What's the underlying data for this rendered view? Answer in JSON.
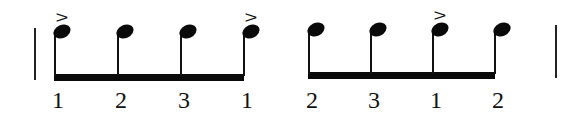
{
  "notation": {
    "barlines": [
      {
        "name": "left-barline",
        "x": 34,
        "top": 28,
        "bottom": 80
      },
      {
        "name": "right-barline",
        "x": 555,
        "top": 25,
        "bottom": 78
      }
    ],
    "groups": [
      {
        "name": "beam-group-1",
        "beam": {
          "x1": 54,
          "x2": 244,
          "y": 74
        },
        "notes": [
          {
            "x": 54,
            "headY": 33,
            "accent": ">",
            "count": "1"
          },
          {
            "x": 117,
            "headY": 33,
            "accent": "",
            "count": "2"
          },
          {
            "x": 180,
            "headY": 33,
            "accent": "",
            "count": "3"
          },
          {
            "x": 243,
            "headY": 33,
            "accent": ">",
            "count": "1"
          }
        ]
      },
      {
        "name": "beam-group-2",
        "beam": {
          "x1": 308,
          "x2": 495,
          "y": 72
        },
        "notes": [
          {
            "x": 308,
            "headY": 31,
            "accent": "",
            "count": "2"
          },
          {
            "x": 370,
            "headY": 31,
            "accent": "",
            "count": "3"
          },
          {
            "x": 432,
            "headY": 31,
            "accent": ">",
            "count": "1"
          },
          {
            "x": 494,
            "headY": 31,
            "accent": "",
            "count": "2"
          }
        ]
      }
    ],
    "counts_baseline_y": 88,
    "accent_glyph": ">"
  }
}
